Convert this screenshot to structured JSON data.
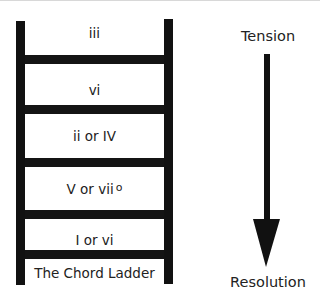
{
  "diagram": {
    "title": "The Chord Ladder",
    "rungs": [
      {
        "label": "iii",
        "superscript": ""
      },
      {
        "label": "vi",
        "superscript": ""
      },
      {
        "label": "ii or IV",
        "superscript": ""
      },
      {
        "label": "V or vii",
        "superscript": "o"
      },
      {
        "label": "I or vi",
        "superscript": ""
      }
    ],
    "axis": {
      "top_label": "Tension",
      "bottom_label": "Resolution",
      "direction": "down-arrow-icon"
    },
    "colors": {
      "ladder": "#111111",
      "text": "#222222",
      "background": "#ffffff"
    }
  }
}
